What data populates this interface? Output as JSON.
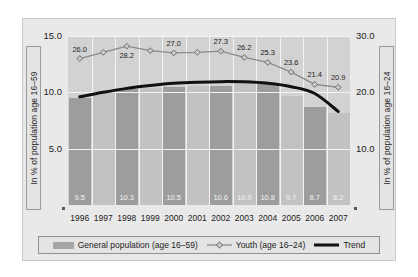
{
  "chart_data": {
    "type": "bar",
    "title": "",
    "subtitle": "",
    "categories": [
      "1996",
      "1997",
      "1998",
      "1999",
      "2000",
      "2001",
      "2002",
      "2003",
      "2004",
      "2005",
      "2006",
      "2007"
    ],
    "xlabel": "",
    "ylabel": "In % of population age 16–59",
    "y2label": "In % of population age 16–24",
    "ylim": [
      0,
      15
    ],
    "y2lim": [
      0,
      30
    ],
    "yticks": [
      "15.0",
      "10.0",
      "5.0"
    ],
    "ytick_values": [
      15.0,
      10.0,
      5.0
    ],
    "y2ticks": [
      "30.0",
      "20.0",
      "10.0"
    ],
    "y2tick_values": [
      30.0,
      20.0,
      10.0
    ],
    "grid": true,
    "legend_position": "bottom",
    "series": [
      {
        "name": "General population (age 16–59)",
        "type": "bar",
        "axis": "left",
        "color": "#9d9d9d",
        "values": [
          9.5,
          9.9,
          10.3,
          10.4,
          10.5,
          10.6,
          10.6,
          10.9,
          10.8,
          9.7,
          8.7,
          8.2
        ],
        "labels": [
          "9.5",
          "",
          "10.3",
          "",
          "10.5",
          "",
          "10.6",
          "10.9",
          "10.8",
          "9.7",
          "8.7",
          "8.2"
        ]
      },
      {
        "name": "Youth (age 16–24)",
        "type": "line",
        "axis": "right",
        "color": "#8a8a8a",
        "marker": "diamond",
        "values": [
          26.0,
          27.1,
          28.2,
          27.4,
          27.0,
          27.1,
          27.3,
          26.2,
          25.3,
          23.6,
          21.4,
          20.9
        ],
        "labels": [
          "26.0",
          "",
          "28.2",
          "",
          "27.0",
          "",
          "27.3",
          "26.2",
          "25.3",
          "23.6",
          "21.4",
          "20.9"
        ]
      },
      {
        "name": "Trend",
        "type": "line",
        "axis": "left",
        "color": "#111111",
        "values": [
          9.6,
          10.0,
          10.35,
          10.6,
          10.8,
          10.9,
          10.95,
          10.93,
          10.8,
          10.5,
          9.9,
          8.3
        ]
      }
    ]
  },
  "axes": {
    "left_title": "In % of population age 16–59",
    "right_title": "In % of population age 16–24"
  },
  "legend": {
    "items": [
      {
        "label": "General population (age 16–59)",
        "marker": "bar-swatch"
      },
      {
        "label": "Youth (age 16–24)",
        "marker": "line-diamond-swatch"
      },
      {
        "label": "Trend",
        "marker": "line-thick-swatch"
      }
    ]
  },
  "colors": {
    "panel_background": "#e9e9e9",
    "plot_background": "#d2d2d2",
    "bar_fill": "#9d9d9d",
    "bar_fill_light": "#c2c2c2",
    "gridline": "#f3f3f3",
    "youth_line": "#8a8a8a",
    "trend_line": "#111111",
    "bar_label_text": "#f4f4f4",
    "axis_text": "#1c1c1c"
  }
}
